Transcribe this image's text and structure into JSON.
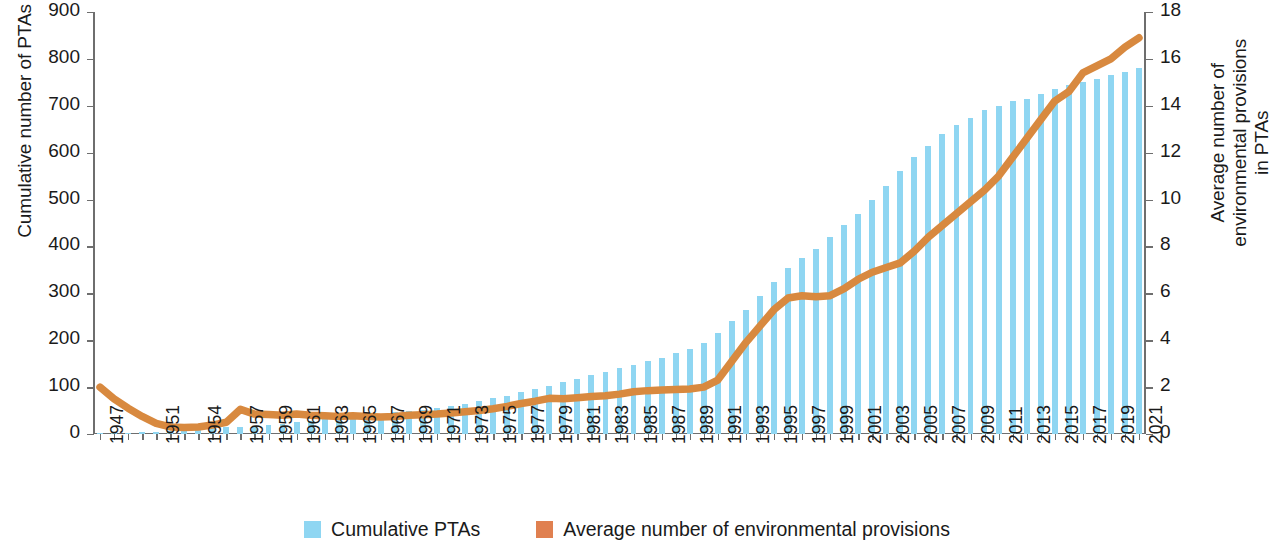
{
  "chart_data": {
    "type": "bar",
    "title": "",
    "xlabel": "",
    "ylabel": "Cumulative number of PTAs",
    "y2label": "Average number of environmental provisions\nin PTAs",
    "ylim": [
      0,
      900
    ],
    "y2lim": [
      0,
      18
    ],
    "grid": false,
    "legend_position": "bottom-center",
    "y_ticks": [
      "0",
      "100",
      "200",
      "300",
      "400",
      "500",
      "600",
      "700",
      "800",
      "900"
    ],
    "y2_ticks": [
      "0",
      "2",
      "4",
      "6",
      "8",
      "10",
      "12",
      "14",
      "16",
      "18"
    ],
    "x_tick_labels": [
      "1947",
      "1951",
      "1954",
      "1957",
      "1959",
      "1961",
      "1963",
      "1965",
      "1967",
      "1969",
      "1971",
      "1973",
      "1975",
      "1977",
      "1979",
      "1981",
      "1983",
      "1985",
      "1987",
      "1989",
      "1991",
      "1993",
      "1995",
      "1997",
      "1999",
      "2001",
      "2003",
      "2005",
      "2007",
      "2009",
      "2011",
      "2013",
      "2015",
      "2017",
      "2019",
      "2021"
    ],
    "x": [
      1947,
      1948,
      1949,
      1950,
      1951,
      1952,
      1953,
      1954,
      1955,
      1956,
      1957,
      1958,
      1959,
      1960,
      1961,
      1962,
      1963,
      1964,
      1965,
      1966,
      1967,
      1968,
      1969,
      1970,
      1971,
      1972,
      1973,
      1974,
      1975,
      1976,
      1977,
      1978,
      1979,
      1980,
      1981,
      1982,
      1983,
      1984,
      1985,
      1986,
      1987,
      1988,
      1989,
      1990,
      1991,
      1992,
      1993,
      1994,
      1995,
      1996,
      1997,
      1998,
      1999,
      2000,
      2001,
      2002,
      2003,
      2004,
      2005,
      2006,
      2007,
      2008,
      2009,
      2010,
      2011,
      2012,
      2013,
      2014,
      2015,
      2016,
      2017,
      2018,
      2019,
      2020,
      2021
    ],
    "series": [
      {
        "name": "Cumulative PTAs",
        "axis": "left",
        "color": "#8fd6f2",
        "kind": "bar",
        "values": [
          1,
          2,
          3,
          4,
          5,
          6,
          8,
          10,
          12,
          14,
          16,
          18,
          20,
          22,
          25,
          28,
          31,
          34,
          37,
          40,
          43,
          46,
          49,
          52,
          56,
          60,
          65,
          70,
          76,
          82,
          89,
          96,
          103,
          110,
          118,
          126,
          133,
          140,
          148,
          155,
          163,
          172,
          181,
          195,
          215,
          240,
          265,
          295,
          325,
          355,
          375,
          395,
          420,
          445,
          470,
          500,
          530,
          560,
          590,
          615,
          640,
          660,
          675,
          690,
          700,
          710,
          715,
          725,
          735,
          745,
          750,
          758,
          765,
          772,
          780
        ]
      },
      {
        "name": "Average number of environmental provisions",
        "axis": "right",
        "color": "#d8893f",
        "kind": "line",
        "values": [
          2.0,
          1.5,
          1.1,
          0.75,
          0.45,
          0.3,
          0.28,
          0.3,
          0.38,
          0.5,
          1.05,
          0.85,
          0.83,
          0.8,
          0.85,
          0.8,
          0.78,
          0.75,
          0.78,
          0.75,
          0.72,
          0.75,
          0.8,
          0.82,
          0.85,
          0.9,
          0.95,
          1.0,
          1.08,
          1.18,
          1.3,
          1.4,
          1.52,
          1.5,
          1.55,
          1.6,
          1.63,
          1.7,
          1.8,
          1.85,
          1.88,
          1.9,
          1.92,
          2.0,
          2.3,
          3.1,
          3.9,
          4.6,
          5.3,
          5.8,
          5.9,
          5.85,
          5.9,
          6.2,
          6.6,
          6.9,
          7.1,
          7.3,
          7.8,
          8.4,
          8.9,
          9.4,
          9.9,
          10.4,
          11.0,
          11.8,
          12.6,
          13.4,
          14.2,
          14.6,
          15.4,
          15.7,
          16.0,
          16.5,
          16.9
        ]
      }
    ]
  },
  "legend": {
    "items": [
      {
        "label": "Cumulative PTAs",
        "color": "#8fd6f2"
      },
      {
        "label": "Average number of environmental provisions",
        "color": "#e08050"
      }
    ]
  },
  "axes": {
    "left_title": "Cumulative number of PTAs",
    "right_title": "Average number of environmental provisions\nin PTAs"
  }
}
